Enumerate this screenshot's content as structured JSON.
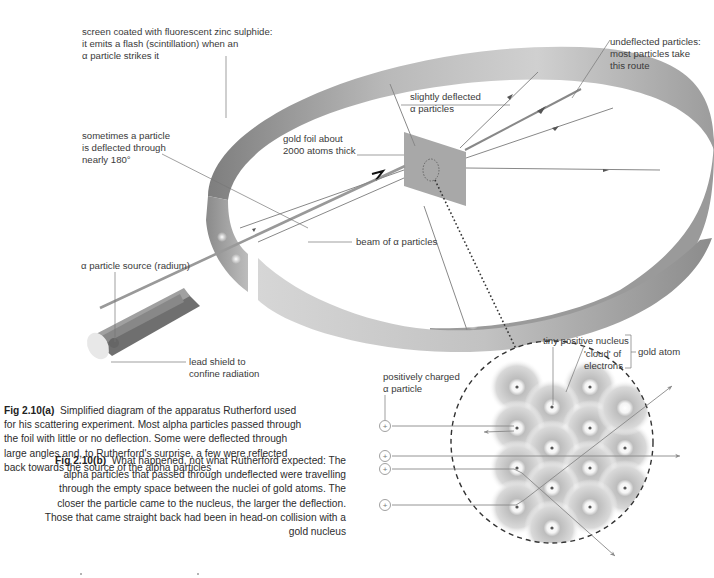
{
  "figure_a": {
    "labels": {
      "screen_line1": "screen coated with fluorescent zinc sulphide:",
      "screen_line2": "it emits a flash (scintillation) when an",
      "screen_line3": "α particle strikes it",
      "undeflected_line1": "undeflected particles:",
      "undeflected_line2": "most particles take",
      "undeflected_line3": "this route",
      "slightly_line1": "slightly deflected",
      "slightly_line2": "α particles",
      "backscatter_line1": "sometimes a particle",
      "backscatter_line2": "is deflected through",
      "backscatter_line3": "nearly 180°",
      "foil_line1": "gold foil about",
      "foil_line2": "2000 atoms thick",
      "beam": "beam of α particles",
      "source": "α particle source (radium)",
      "shield_line1": "lead shield to",
      "shield_line2": "confine radiation"
    },
    "caption_title": "Fig 2.10(a)",
    "caption_text": "Simplified diagram of the apparatus Rutherford used for his scattering experiment. Most alpha particles passed through the foil with little or no deflection. Some were deflected through large angles and, to Rutherford's surprise, a few were reflected back towards the source of the alpha particles"
  },
  "figure_b": {
    "labels": {
      "nucleus": "tiny positive nucleus",
      "cloud_line1": "'cloud' of",
      "cloud_line2": "electrons",
      "gold_atom": "gold atom",
      "alpha_line1": "positively charged",
      "alpha_line2": "α particle",
      "plus": "+"
    },
    "caption_title": "Fig 2.10(b)",
    "caption_text": "What happened, not what Rutherford expected: The alpha particles that passed through undeflected were travelling through the empty space between the nuclei of gold atoms. The closer the particle came to the nucleus, the larger the deflection. Those that came straight back had been in head-on collision with a gold nucleus"
  },
  "colors": {
    "screen_dark": "#8a8a8a",
    "screen_light": "#d4d4d4",
    "foil": "#a8a8a8",
    "line": "#7a7a7a",
    "text": "#3a3a3a"
  }
}
